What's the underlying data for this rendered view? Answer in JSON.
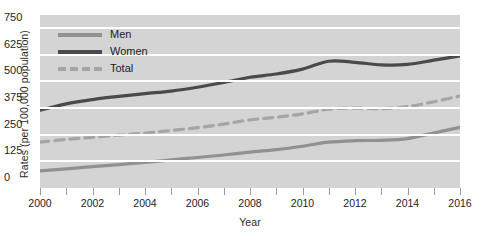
{
  "chart_data": {
    "type": "line",
    "title": "",
    "xlabel": "Year",
    "ylabel": "Rates (per 100,000 population)",
    "xlim": [
      2000,
      2016
    ],
    "ylim": [
      0,
      812
    ],
    "grid": true,
    "legend_position": "top-left",
    "y_ticks": [
      750,
      625,
      500,
      375,
      250,
      125,
      0
    ],
    "x_ticks": [
      2000,
      2001,
      2002,
      2003,
      2004,
      2005,
      2006,
      2007,
      2008,
      2009,
      2010,
      2011,
      2012,
      2013,
      2014,
      2015,
      2016
    ],
    "x_tick_labels": [
      "2000",
      "",
      "2002",
      "",
      "2004",
      "",
      "2006",
      "",
      "2008",
      "",
      "2010",
      "",
      "2012",
      "",
      "2014",
      "",
      "2016"
    ],
    "x": [
      2000,
      2001,
      2002,
      2003,
      2004,
      2005,
      2006,
      2007,
      2008,
      2009,
      2010,
      2011,
      2012,
      2013,
      2014,
      2015,
      2016
    ],
    "series": [
      {
        "name": "Men",
        "style": "solid",
        "color": "#919191",
        "values": [
          80,
          90,
          100,
          110,
          120,
          132,
          143,
          155,
          168,
          180,
          196,
          215,
          222,
          224,
          232,
          258,
          285
        ]
      },
      {
        "name": "Women",
        "style": "solid",
        "color": "#4a4a4a",
        "values": [
          365,
          395,
          415,
          430,
          443,
          455,
          473,
          495,
          520,
          535,
          558,
          595,
          590,
          578,
          580,
          600,
          620
        ]
      },
      {
        "name": "Total",
        "style": "dashed",
        "color": "#a5a5a5",
        "values": [
          215,
          228,
          238,
          248,
          258,
          270,
          283,
          300,
          320,
          332,
          348,
          370,
          375,
          372,
          382,
          405,
          432
        ]
      }
    ]
  },
  "colors": {
    "plot_background": "#d4d4d4",
    "gridline": "#ffffff",
    "page_background": "#ffffff",
    "text": "#1d1d1d"
  }
}
